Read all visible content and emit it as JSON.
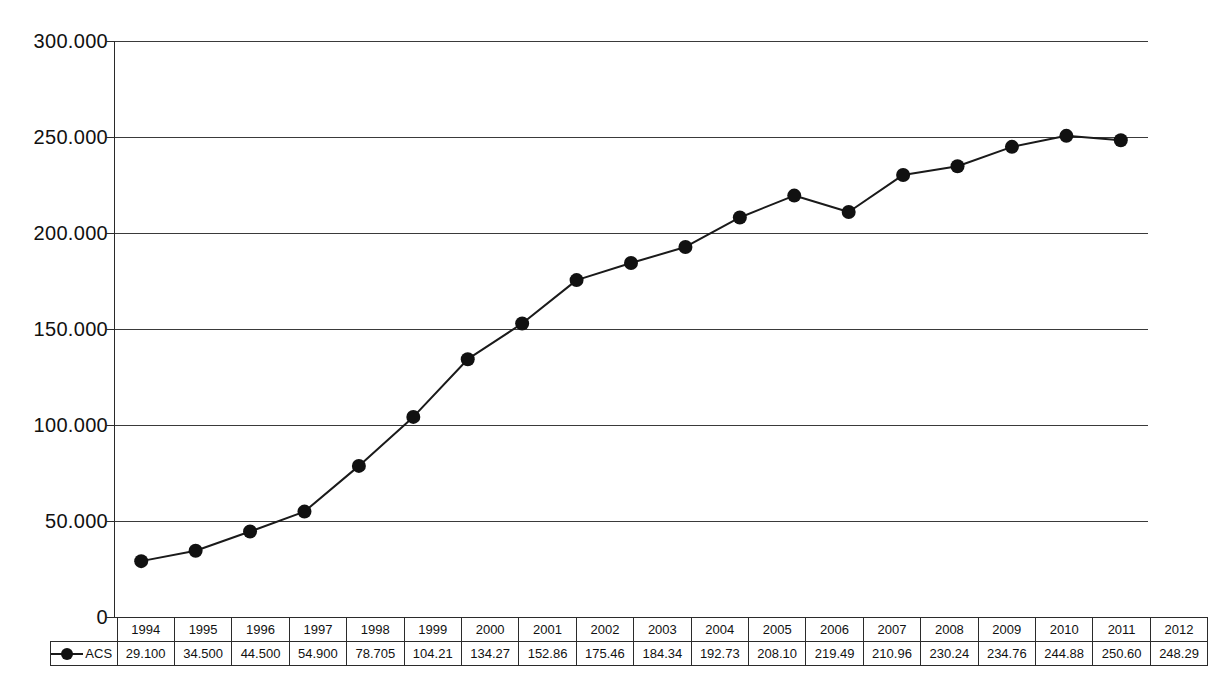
{
  "chart_data": {
    "type": "line",
    "title": "",
    "subtitle": "",
    "xlabel": "",
    "ylabel": "",
    "ylim": [
      0,
      300000
    ],
    "ytick_labels": [
      "0",
      "50.000",
      "100.000",
      "150.000",
      "200.000",
      "250.000",
      "300.000"
    ],
    "ytick_values": [
      0,
      50000,
      100000,
      150000,
      200000,
      250000,
      300000
    ],
    "grid": true,
    "legend_position": "table-row-left",
    "marker": "filled-circle",
    "line_color": "#1a1a1a",
    "marker_color": "#111111",
    "categories": [
      "1994",
      "1995",
      "1996",
      "1997",
      "1998",
      "1999",
      "2000",
      "2001",
      "2002",
      "2003",
      "2004",
      "2005",
      "2006",
      "2007",
      "2008",
      "2009",
      "2010",
      "2011",
      "2012"
    ],
    "series": [
      {
        "name": "ACS",
        "value_labels": [
          "29.100",
          "34.500",
          "44.500",
          "54.900",
          "78.705",
          "104.21",
          "134.27",
          "152.86",
          "175.46",
          "184.34",
          "192.73",
          "208.10",
          "219.49",
          "210.96",
          "230.24",
          "234.76",
          "244.88",
          "250.60",
          "248.29"
        ],
        "values": [
          29100,
          34500,
          44500,
          54900,
          78705,
          104210,
          134270,
          152860,
          175460,
          184340,
          192730,
          208100,
          219490,
          210960,
          230240,
          234760,
          244880,
          250600,
          248290
        ]
      }
    ]
  },
  "table": {
    "legend_label": "ACS",
    "header_row": [
      "1994",
      "1995",
      "1996",
      "1997",
      "1998",
      "1999",
      "2000",
      "2001",
      "2002",
      "2003",
      "2004",
      "2005",
      "2006",
      "2007",
      "2008",
      "2009",
      "2010",
      "2011",
      "2012"
    ],
    "value_row": [
      "29.100",
      "34.500",
      "44.500",
      "54.900",
      "78.705",
      "104.21",
      "134.27",
      "152.86",
      "175.46",
      "184.34",
      "192.73",
      "208.10",
      "219.49",
      "210.96",
      "230.24",
      "234.76",
      "244.88",
      "250.60",
      "248.29"
    ]
  }
}
